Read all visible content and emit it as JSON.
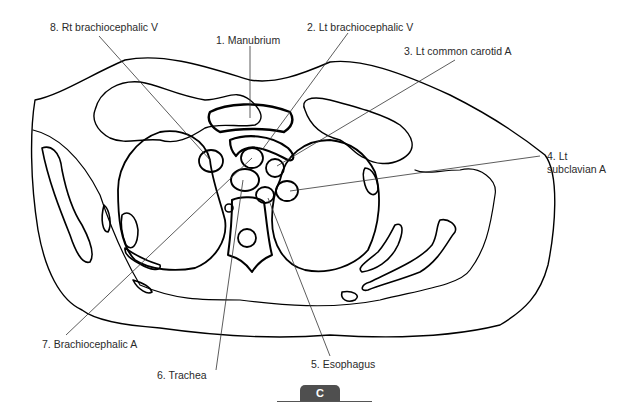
{
  "figure": {
    "panel_label": "C",
    "labels": [
      {
        "id": 1,
        "text": "1. Manubrium"
      },
      {
        "id": 2,
        "text": "2. Lt brachiocephalic V"
      },
      {
        "id": 3,
        "text": "3. Lt common carotid A"
      },
      {
        "id": 4,
        "line1": "4. Lt",
        "line2": "subclavian A"
      },
      {
        "id": 5,
        "text": "5. Esophagus"
      },
      {
        "id": 6,
        "text": "6. Trachea"
      },
      {
        "id": 7,
        "text": "7. Brachiocephalic A"
      },
      {
        "id": 8,
        "text": "8. Rt brachiocephalic V"
      }
    ]
  },
  "colors": {
    "outline": "#000000",
    "leader_line": "#333333",
    "label_text": "#2a2a2a",
    "badge_bg": "#4f4f4f",
    "badge_text": "#ffffff"
  }
}
